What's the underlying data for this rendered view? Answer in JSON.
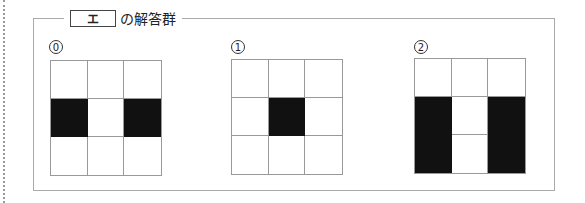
{
  "header": {
    "boxed_label": "エ",
    "suffix_text": "の解答群"
  },
  "options": [
    {
      "number": "0",
      "grid": [
        [
          0,
          0,
          0
        ],
        [
          1,
          0,
          1
        ],
        [
          0,
          0,
          0
        ]
      ]
    },
    {
      "number": "1",
      "grid": [
        [
          0,
          0,
          0
        ],
        [
          0,
          1,
          0
        ],
        [
          0,
          0,
          0
        ]
      ]
    },
    {
      "number": "2",
      "grid": [
        [
          0,
          0,
          0
        ],
        [
          1,
          0,
          1
        ],
        [
          1,
          0,
          1
        ]
      ]
    }
  ],
  "colors": {
    "filled": "#111111",
    "empty": "#ffffff",
    "grid_line": "#999999"
  }
}
